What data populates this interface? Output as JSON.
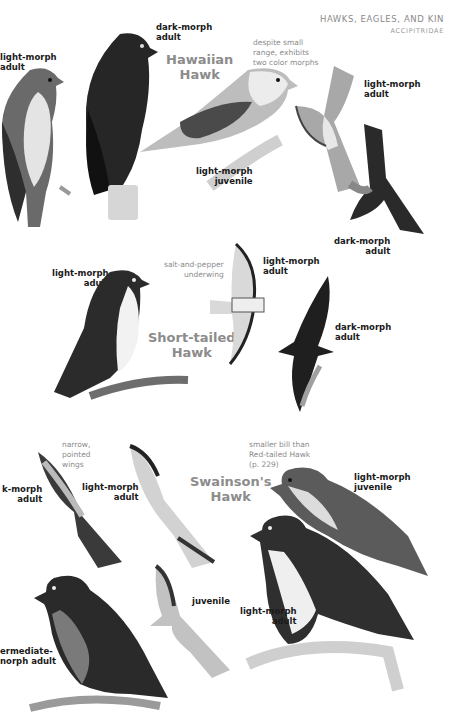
{
  "header": {
    "title": "HAWKS, EAGLES, AND KIN",
    "subtitle": "ACCIPITRIDAE"
  },
  "sections": [
    {
      "species": {
        "line1": "Hawaiian",
        "line2": "Hawk"
      },
      "note": {
        "line1": "despite small",
        "line2": "range, exhibits",
        "line3": "two color morphs"
      },
      "labels": [
        {
          "line1": "light-morph",
          "line2": "adult"
        },
        {
          "line1": "dark-morph",
          "line2": "adult"
        },
        {
          "line1": "light-morph",
          "line2": "juvenile"
        },
        {
          "line1": "light-morph",
          "line2": "adult"
        },
        {
          "line1": "dark-morph",
          "line2": "adult"
        }
      ]
    },
    {
      "species": {
        "line1": "Short-tailed",
        "line2": "Hawk"
      },
      "note": {
        "line1": "salt-and-pepper",
        "line2": "underwing"
      },
      "labels": [
        {
          "line1": "light-morph",
          "line2": "adult"
        },
        {
          "line1": "light-morph",
          "line2": "adult"
        },
        {
          "line1": "dark-morph",
          "line2": "adult"
        }
      ]
    },
    {
      "species": {
        "line1": "Swainson's",
        "line2": "Hawk"
      },
      "note_wings": {
        "line1": "narrow,",
        "line2": "pointed",
        "line3": "wings"
      },
      "note_bill": {
        "line1": "smaller bill than",
        "line2": "Red-tailed Hawk",
        "line3": "(p. 229)"
      },
      "labels": [
        {
          "line1": "k-morph",
          "line2": "adult"
        },
        {
          "line1": "light-morph",
          "line2": "adult"
        },
        {
          "line1": "light-morph",
          "line2": "juvenile"
        },
        {
          "line1": "juvenile"
        },
        {
          "line1": "light-morph",
          "line2": "adult"
        },
        {
          "line1": "ermediate-",
          "line2": "norph adult"
        }
      ]
    }
  ],
  "colors": {
    "ink_dark": "#1c1c1c",
    "ink_mid": "#5a5a5a",
    "ink_light": "#b8b8b8",
    "paper": "#ffffff",
    "species_gray": "#8c8c8c"
  }
}
